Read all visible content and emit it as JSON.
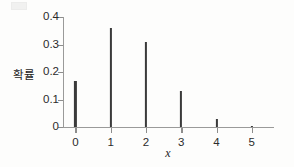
{
  "chart_data": {
    "type": "bar",
    "title": "",
    "subtitle": "",
    "xlabel": "x",
    "ylabel": "확률",
    "categories": [
      "0",
      "1",
      "2",
      "3",
      "4",
      "5"
    ],
    "x": [
      0,
      1,
      2,
      3,
      4,
      5
    ],
    "values": [
      0.168,
      0.36,
      0.309,
      0.132,
      0.028,
      0.002
    ],
    "xlim": [
      -0.35,
      5.6
    ],
    "ylim": [
      0,
      0.4
    ],
    "xticks": [
      "0",
      "1",
      "2",
      "3",
      "4",
      "5"
    ],
    "yticks": [
      "0",
      "0.1",
      "0.2",
      "0.3",
      "0.4"
    ],
    "ytick_values": [
      0,
      0.1,
      0.2,
      0.3,
      0.4
    ],
    "grid": false,
    "legend": null,
    "annotations": [],
    "style": {
      "bar_color": "#3a3a3a",
      "axis_color": "#9a9a99",
      "tick_color": "#8d8d8c",
      "text_color": "#2b2b2b",
      "background": "#fdfdfc"
    }
  }
}
